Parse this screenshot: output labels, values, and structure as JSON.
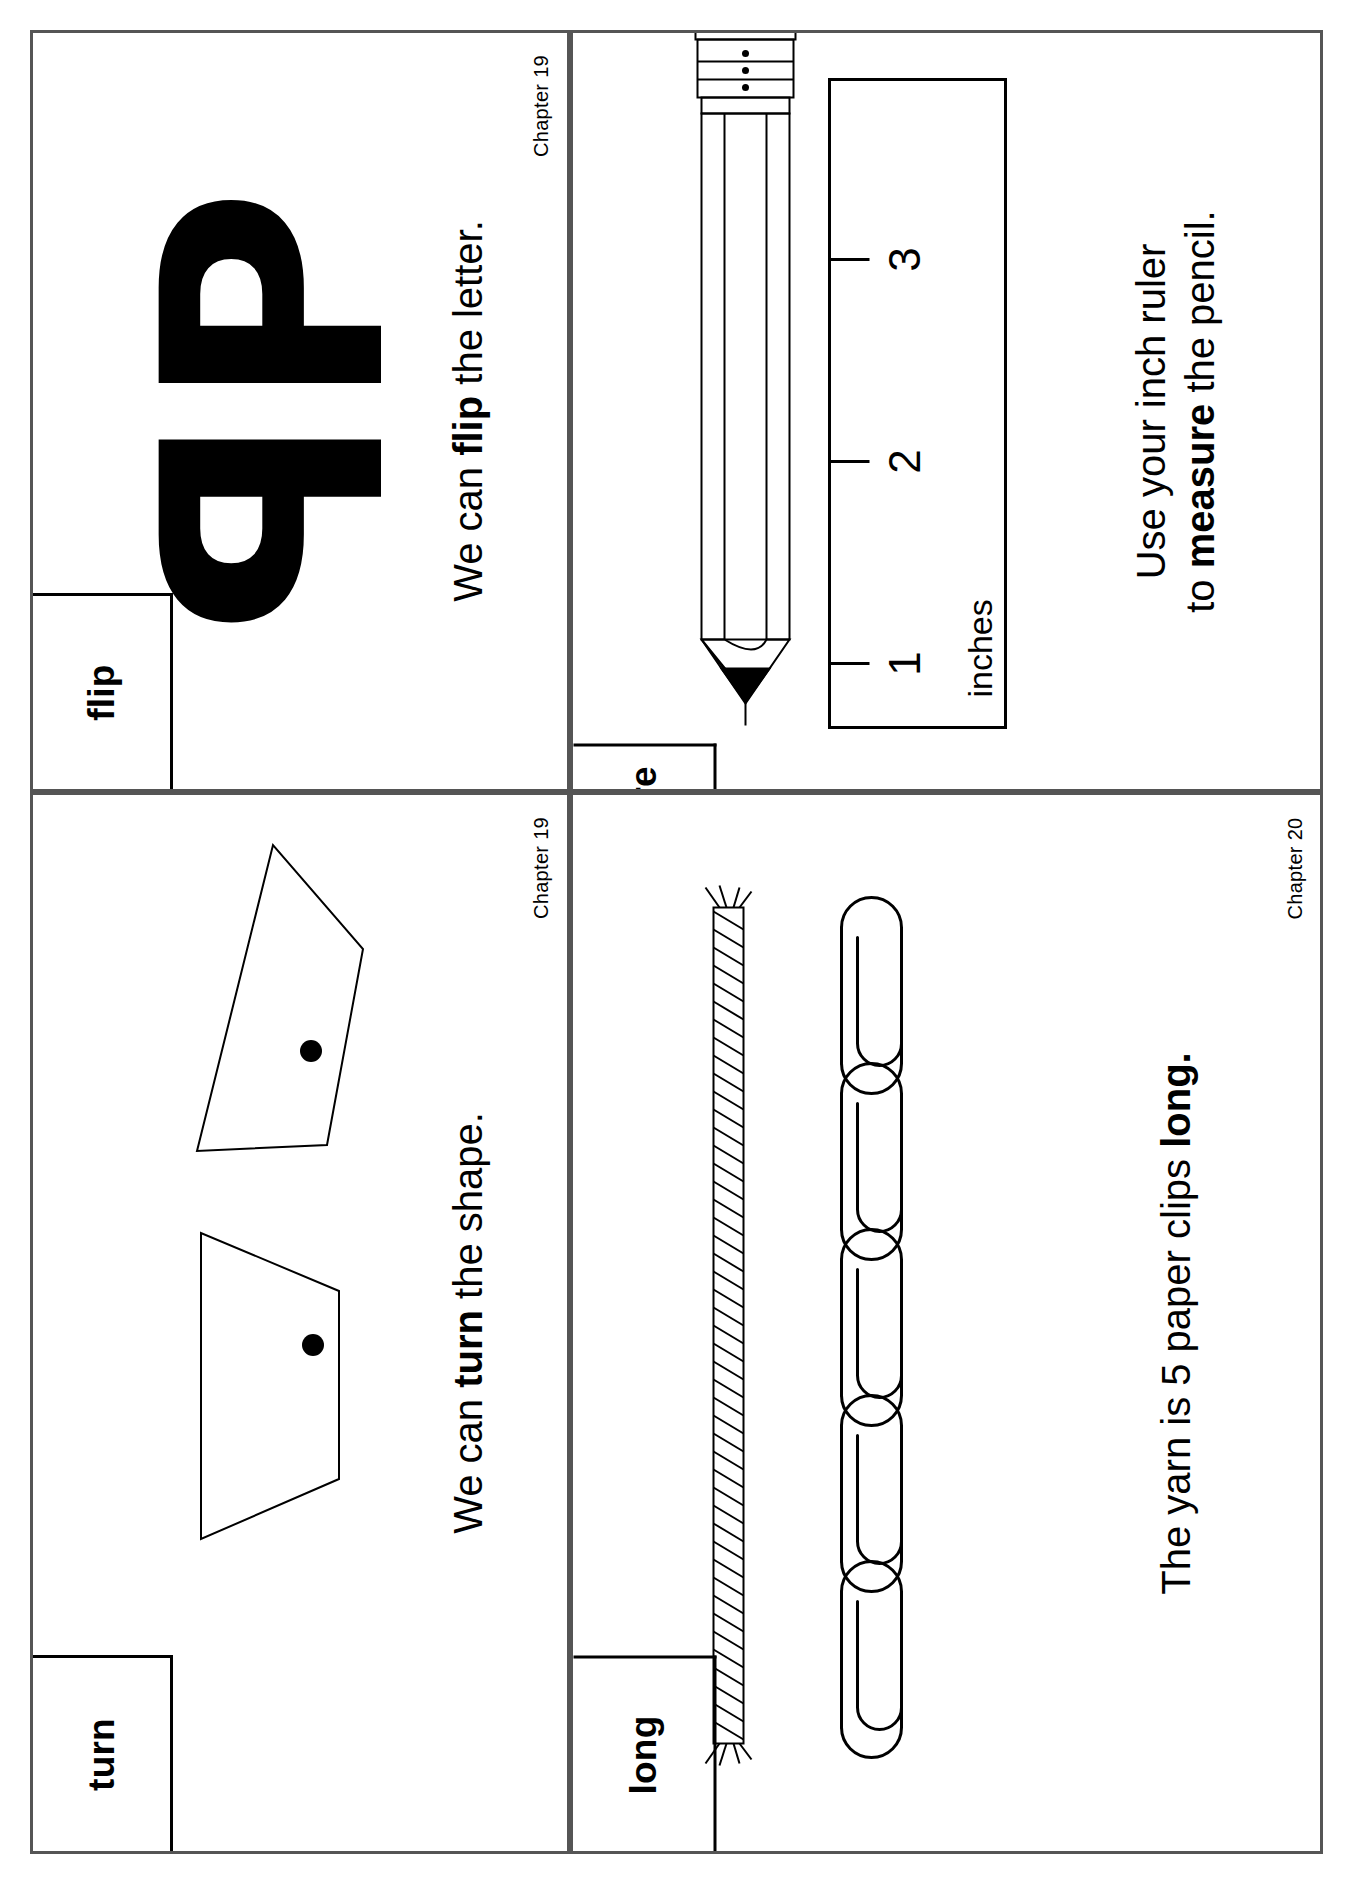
{
  "page": {
    "layout": "2x2 flashcard sheet, printed sideways (rotated 90 degrees)",
    "ink_color": "#000000",
    "card_border_color": "#555555",
    "background": "#ffffff"
  },
  "cards": [
    {
      "id": "flip",
      "word": "flip",
      "chapter": "Chapter 19",
      "sentence_prefix": "We can ",
      "sentence_bold": "flip",
      "sentence_suffix": " the letter.",
      "sentence_full": "We can flip the letter.",
      "art": {
        "type": "mirrored-letter-pair",
        "glyph": "P",
        "description": "capital letter P shown next to its mirror image"
      }
    },
    {
      "id": "turn",
      "word": "turn",
      "chapter": "Chapter 19",
      "sentence_prefix": "We can ",
      "sentence_bold": "turn",
      "sentence_suffix": " the shape.",
      "sentence_full": "We can turn the shape.",
      "art": {
        "type": "rotated-quadrilateral-pair",
        "description": "a trapezoid with a dot, shown again rotated"
      }
    },
    {
      "id": "measure",
      "word": "measure",
      "chapter": "Chapter 20",
      "sentence_prefix": "Use your inch ruler to ",
      "sentence_bold": "measure",
      "sentence_suffix": " the pencil.",
      "sentence_line1": "Use your inch ruler",
      "sentence_line2_prefix": "to ",
      "sentence_line2_bold": "measure",
      "sentence_line2_suffix": " the pencil.",
      "sentence_full": "Use your inch ruler to measure the pencil.",
      "art": {
        "type": "pencil-and-ruler",
        "ruler_unit_label": "inches",
        "ruler_ticks": [
          "1",
          "2",
          "3"
        ],
        "description": "a sharpened pencil lying beside an inch ruler marked 1, 2, 3"
      }
    },
    {
      "id": "long",
      "word": "long",
      "chapter": "Chapter 20",
      "sentence_prefix": "The yarn is 5 paper clips ",
      "sentence_bold": "long.",
      "sentence_suffix": "",
      "sentence_full": "The yarn is 5 paper clips long.",
      "art": {
        "type": "yarn-and-paperclips",
        "paper_clip_count": 5,
        "description": "a length of yarn next to a row of five paper clips"
      }
    }
  ]
}
